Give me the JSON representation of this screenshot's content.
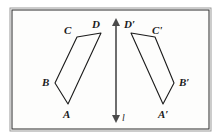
{
  "figure": {
    "kind": "geometry-reflection-diagram",
    "canvas": {
      "width": 223,
      "height": 138
    },
    "colors": {
      "background": "#fdfdfc",
      "frame_outer": "#8d8d8d",
      "frame_inner": "#2b2b2b",
      "stroke": "#1b1b1b",
      "axis": "#4a4a4a",
      "label": "#1b1b1b"
    },
    "frame": {
      "x": 10,
      "y": 8,
      "width": 201,
      "height": 123
    },
    "mirror_line": {
      "name": "l",
      "label": "l",
      "x": 116,
      "y_top": 18,
      "y_bottom": 123,
      "double_headed": true,
      "label_x": 122,
      "label_y": 113
    },
    "shapes": [
      {
        "name": "quadrilateral-abcd",
        "closed": true,
        "points": [
          {
            "id": "A",
            "label": "A",
            "x": 68,
            "y": 104,
            "label_x": 63,
            "label_y": 109
          },
          {
            "id": "B",
            "label": "B",
            "x": 55,
            "y": 83,
            "label_x": 42,
            "label_y": 77
          },
          {
            "id": "C",
            "label": "C",
            "x": 77,
            "y": 37,
            "label_x": 64,
            "label_y": 25
          },
          {
            "id": "D",
            "label": "D",
            "x": 101,
            "y": 33,
            "label_x": 92,
            "label_y": 19
          }
        ]
      },
      {
        "name": "quadrilateral-abcd-prime",
        "closed": true,
        "points": [
          {
            "id": "A'",
            "label": "A′",
            "x": 163,
            "y": 104,
            "label_x": 158,
            "label_y": 109
          },
          {
            "id": "B'",
            "label": "B′",
            "x": 174,
            "y": 83,
            "label_x": 179,
            "label_y": 77
          },
          {
            "id": "C'",
            "label": "C'",
            "x": 155,
            "y": 37,
            "label_x": 152,
            "label_y": 25
          },
          {
            "id": "D'",
            "label": "D′",
            "x": 131,
            "y": 33,
            "label_x": 124,
            "label_y": 19
          }
        ]
      }
    ]
  }
}
